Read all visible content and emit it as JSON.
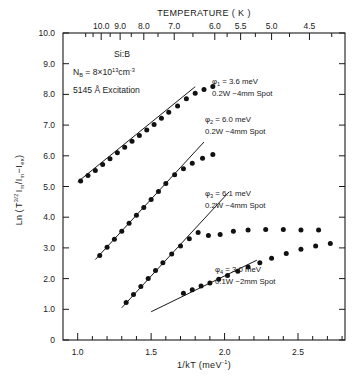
{
  "chart_data": {
    "type": "scatter",
    "title": "",
    "xlabel": "1/kT  (meV⁻¹)",
    "ylabel": "Ln ( T^(3/2) I_m / (I_m − I_ex) )",
    "top_axis_label": "TEMPERATURE  ( K )",
    "xlim": [
      0.9,
      2.82
    ],
    "ylim": [
      0,
      10
    ],
    "grid": false,
    "legend": "annotations-inline",
    "xticks": [
      1.0,
      1.5,
      2.0,
      2.5
    ],
    "xtick_labels": [
      "1.0",
      "1.5",
      "2.0",
      "2.5"
    ],
    "xminor_step": 0.1,
    "yticks": [
      0,
      1,
      2,
      3,
      4,
      5,
      6,
      7,
      8,
      9,
      10
    ],
    "ytick_labels": [
      "0",
      "1.0",
      "2.0",
      "3.0",
      "4.0",
      "5.0",
      "6.0",
      "7.0",
      "8.0",
      "9.0",
      "10.0"
    ],
    "top_ticks_K": [
      10.0,
      9.0,
      8.0,
      7.0,
      6.0,
      5.5,
      5.0,
      4.5
    ],
    "top_tick_labels": [
      "10.0",
      "9.0",
      "8.0",
      "7.0",
      "6.0",
      "5.5",
      "5.0",
      "4.5"
    ],
    "series": [
      {
        "name": "phi_1",
        "phi_label": "φ",
        "phi_index": "1",
        "phi_value": "3.6 meV",
        "power_spot": "0.2W  ~4mm Spot",
        "fit_line": {
          "x1": 1.0,
          "y1": 5.15,
          "x2": 1.8,
          "y2": 8.25
        },
        "points": [
          {
            "x": 1.02,
            "y": 5.18
          },
          {
            "x": 1.07,
            "y": 5.36
          },
          {
            "x": 1.12,
            "y": 5.52
          },
          {
            "x": 1.17,
            "y": 5.72
          },
          {
            "x": 1.22,
            "y": 5.9
          },
          {
            "x": 1.27,
            "y": 6.1
          },
          {
            "x": 1.32,
            "y": 6.28
          },
          {
            "x": 1.37,
            "y": 6.47
          },
          {
            "x": 1.42,
            "y": 6.66
          },
          {
            "x": 1.47,
            "y": 6.84
          },
          {
            "x": 1.52,
            "y": 7.02
          },
          {
            "x": 1.57,
            "y": 7.22
          },
          {
            "x": 1.62,
            "y": 7.42
          },
          {
            "x": 1.68,
            "y": 7.62
          },
          {
            "x": 1.74,
            "y": 7.86
          },
          {
            "x": 1.8,
            "y": 8.04
          },
          {
            "x": 1.86,
            "y": 8.16
          },
          {
            "x": 1.92,
            "y": 8.26
          }
        ]
      },
      {
        "name": "phi_2",
        "phi_label": "φ",
        "phi_index": "2",
        "phi_value": "6.0 meV",
        "power_spot": "0.2W  ~4mm Spot",
        "fit_line": {
          "x1": 1.12,
          "y1": 2.62,
          "x2": 1.86,
          "y2": 6.45
        },
        "points": [
          {
            "x": 1.15,
            "y": 2.75
          },
          {
            "x": 1.2,
            "y": 3.02
          },
          {
            "x": 1.25,
            "y": 3.28
          },
          {
            "x": 1.3,
            "y": 3.54
          },
          {
            "x": 1.35,
            "y": 3.8
          },
          {
            "x": 1.4,
            "y": 4.06
          },
          {
            "x": 1.45,
            "y": 4.32
          },
          {
            "x": 1.5,
            "y": 4.58
          },
          {
            "x": 1.55,
            "y": 4.84
          },
          {
            "x": 1.6,
            "y": 5.1
          },
          {
            "x": 1.66,
            "y": 5.38
          },
          {
            "x": 1.72,
            "y": 5.58
          },
          {
            "x": 1.78,
            "y": 5.76
          },
          {
            "x": 1.85,
            "y": 5.92
          },
          {
            "x": 1.92,
            "y": 6.04
          }
        ]
      },
      {
        "name": "phi_3",
        "phi_label": "φ",
        "phi_index": "3",
        "phi_value": "6.1 meV",
        "power_spot": "0.2W  ~4mm Spot",
        "fit_line": {
          "x1": 1.3,
          "y1": 1.05,
          "x2": 2.03,
          "y2": 4.82
        },
        "points": [
          {
            "x": 1.33,
            "y": 1.22
          },
          {
            "x": 1.38,
            "y": 1.48
          },
          {
            "x": 1.43,
            "y": 1.74
          },
          {
            "x": 1.48,
            "y": 2.0
          },
          {
            "x": 1.53,
            "y": 2.26
          },
          {
            "x": 1.58,
            "y": 2.52
          },
          {
            "x": 1.64,
            "y": 2.8
          },
          {
            "x": 1.7,
            "y": 3.06
          },
          {
            "x": 1.76,
            "y": 3.3
          },
          {
            "x": 1.82,
            "y": 3.5
          },
          {
            "x": 1.89,
            "y": 3.4
          },
          {
            "x": 1.97,
            "y": 3.44
          },
          {
            "x": 2.06,
            "y": 3.54
          },
          {
            "x": 2.16,
            "y": 3.58
          },
          {
            "x": 2.28,
            "y": 3.6
          },
          {
            "x": 2.4,
            "y": 3.6
          },
          {
            "x": 2.52,
            "y": 3.58
          },
          {
            "x": 2.64,
            "y": 3.58
          }
        ]
      },
      {
        "name": "phi_4",
        "phi_label": "φ",
        "phi_index": "4",
        "phi_value": "3.0 meV",
        "power_spot": "0.1W  ~2mm Spot",
        "fit_line": {
          "x1": 1.5,
          "y1": 0.92,
          "x2": 2.22,
          "y2": 2.6
        },
        "points": [
          {
            "x": 1.72,
            "y": 1.52
          },
          {
            "x": 1.78,
            "y": 1.64
          },
          {
            "x": 1.84,
            "y": 1.76
          },
          {
            "x": 1.9,
            "y": 1.86
          },
          {
            "x": 1.96,
            "y": 1.98
          },
          {
            "x": 2.02,
            "y": 2.1
          },
          {
            "x": 2.09,
            "y": 2.24
          },
          {
            "x": 2.16,
            "y": 2.38
          },
          {
            "x": 2.24,
            "y": 2.52
          },
          {
            "x": 2.32,
            "y": 2.66
          },
          {
            "x": 2.42,
            "y": 2.82
          },
          {
            "x": 2.52,
            "y": 2.96
          },
          {
            "x": 2.62,
            "y": 3.06
          },
          {
            "x": 2.72,
            "y": 3.14
          }
        ]
      }
    ]
  },
  "sample": {
    "material": "Si:B",
    "density_prefix": "N",
    "density_sub": "B",
    "density_eq": " = 8×10",
    "density_exp": "13",
    "density_unit": "cm",
    "density_unit_exp": "-3",
    "excitation": "5145 Å  Excitation"
  },
  "axis": {
    "top_title": "TEMPERATURE  ( K )",
    "bottom_title_main": "1/kT  (meV",
    "bottom_title_exp": "-1",
    "bottom_title_tail": ")",
    "ylabel_ln": "Ln",
    "ylabel_num_T": "T",
    "ylabel_num_exp": "3/2",
    "ylabel_num_I": "I",
    "ylabel_num_I_sub": "m",
    "ylabel_den": "I",
    "ylabel_den_sub1": "m",
    "ylabel_den_minus": "−I",
    "ylabel_den_sub2": "ex"
  },
  "style": {
    "ink": "#1a1a1a",
    "point_color": "#111111",
    "background": "#ffffff"
  }
}
